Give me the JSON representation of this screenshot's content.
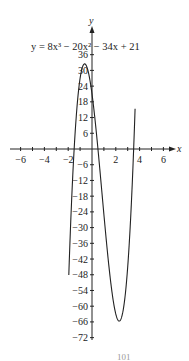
{
  "chart_data": {
    "type": "line",
    "title": "y = 8x³ − 20x² − 34x + 21",
    "xlabel": "x",
    "ylabel": "y",
    "xlim": [
      -6.5,
      6.8
    ],
    "ylim": [
      -74,
      40
    ],
    "x_ticks": [
      -6,
      -4,
      -2,
      2,
      4,
      6
    ],
    "y_ticks": [
      36,
      30,
      24,
      18,
      12,
      6,
      -6,
      -12,
      -18,
      -24,
      -30,
      -36,
      -42,
      -48,
      -54,
      -60,
      -66,
      -72
    ],
    "grid": false,
    "series": [
      {
        "name": "y = 8x^3 - 20x^2 - 34x + 21",
        "coefficients": [
          8,
          -20,
          -34,
          21
        ],
        "x_range": [
          -1.95,
          3.62
        ],
        "key_points": {
          "local_max": [
            -0.6,
            32.5
          ],
          "local_min": [
            2.27,
            -65.6
          ],
          "roots": [
            -1.5,
            0.5,
            3.5
          ]
        }
      }
    ]
  },
  "equation_label": "y = 8x³ − 20x² − 34x + 21",
  "footer_fragment": "101"
}
